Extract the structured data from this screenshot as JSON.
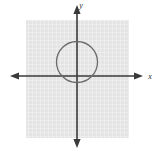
{
  "figure": {
    "width": 159,
    "height": 153,
    "background_color": "#ffffff"
  },
  "grid": {
    "name": "grid-square",
    "x": 26,
    "y": 20,
    "width": 103,
    "height": 118,
    "cell_size": 4,
    "fill_color": "#e2e2e2",
    "line_color": "#f2f2f2",
    "visible": true
  },
  "axes": {
    "color": "#3a3a3a",
    "stroke_width": 1.6,
    "origin": {
      "x": 77,
      "y": 76
    },
    "x_axis": {
      "name": "x-axis",
      "x_start": 10,
      "x_end": 143,
      "y": 76,
      "arrow_left": true,
      "arrow_right": true
    },
    "y_axis": {
      "name": "y-axis",
      "x": 77,
      "y_start": 5,
      "y_end": 148,
      "arrow_up": true,
      "arrow_down": true
    },
    "x_label": "x",
    "y_label": "y",
    "x_label_pos": {
      "x": 150,
      "y": 79
    },
    "y_label_pos": {
      "x": 81,
      "y": 8
    }
  },
  "circle": {
    "name": "circle-shape",
    "center_x": 77,
    "center_y": 62,
    "radius": 20.5,
    "stroke_color": "#6b6b6b",
    "stroke_width": 1.3,
    "fill": "none"
  },
  "chart_data": {
    "type": "scatter",
    "xlabel": "x",
    "ylabel": "y",
    "grid": true,
    "legend": "none",
    "series": [
      {
        "name": "circle",
        "shape": "circle",
        "center": [
          0,
          3.5
        ],
        "radius": 5.1,
        "filled": false
      }
    ],
    "annotations": [
      "Circle centered slightly above the origin on the y-axis",
      "Circle passes near the origin at its lowest point"
    ]
  }
}
